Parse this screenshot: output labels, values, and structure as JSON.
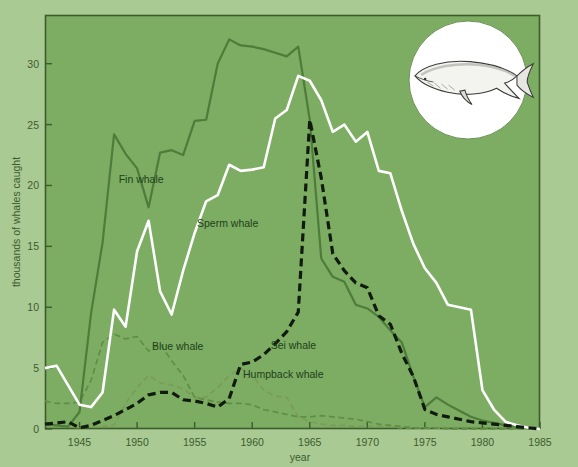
{
  "figure": {
    "outer_background": "#a9ca92",
    "plot_background": "#7dad63",
    "plot_border_color": "#3d5c2e",
    "inset": {
      "name": "blue-whale-illustration",
      "shape": "circle",
      "background": "#ffffff",
      "caption": ""
    }
  },
  "axes": {
    "x": {
      "label": "year",
      "ticks": [
        1945,
        1950,
        1955,
        1960,
        1965,
        1970,
        1975,
        1980,
        1985
      ],
      "tick_labels": [
        "1945",
        "1950",
        "1955",
        "1960",
        "1965",
        "1970",
        "1975",
        "1980",
        "1985"
      ],
      "range": [
        1942,
        1985
      ]
    },
    "y": {
      "label": "thousands of whales caught",
      "ticks": [
        0,
        5,
        10,
        15,
        20,
        25,
        30
      ],
      "tick_labels": [
        "0",
        "5",
        "10",
        "15",
        "20",
        "25",
        "30"
      ],
      "range": [
        0,
        34
      ]
    }
  },
  "chart_data": {
    "type": "line",
    "title": "",
    "subtitle": "",
    "xlabel": "year",
    "ylabel": "thousands of whales caught",
    "xlim": [
      1942,
      1985
    ],
    "ylim": [
      0,
      34
    ],
    "grid": false,
    "legend_position": "inline-labels",
    "x": [
      1942,
      1943,
      1944,
      1945,
      1946,
      1947,
      1948,
      1949,
      1950,
      1951,
      1952,
      1953,
      1954,
      1955,
      1956,
      1957,
      1958,
      1959,
      1960,
      1961,
      1962,
      1963,
      1964,
      1965,
      1966,
      1967,
      1968,
      1969,
      1970,
      1971,
      1972,
      1973,
      1974,
      1975,
      1976,
      1977,
      1978,
      1979,
      1980,
      1981,
      1982,
      1983,
      1984,
      1985
    ],
    "series": [
      {
        "name": "Fin whale",
        "color": "#4e7c3a",
        "style": "solid",
        "label_text": "Fin whale",
        "label_x": 1948.4,
        "label_y": 20.2,
        "values": [
          0.4,
          0.3,
          0.2,
          1.4,
          9.5,
          15.3,
          24.2,
          22.6,
          21.4,
          18.2,
          22.7,
          22.9,
          22.5,
          25.3,
          25.4,
          30.0,
          32.0,
          31.5,
          31.4,
          31.2,
          30.9,
          30.6,
          31.4,
          25.4,
          14.0,
          12.5,
          12.1,
          10.2,
          9.9,
          9.2,
          8.1,
          7.1,
          4.3,
          1.8,
          2.6,
          2.0,
          1.5,
          1.0,
          0.7,
          0.5,
          0.3,
          0.2,
          0.1,
          0.0
        ]
      },
      {
        "name": "Sperm whale",
        "color": "#ffffff",
        "style": "solid",
        "label_text": "Sperm whale",
        "label_x": 1955.2,
        "label_y": 16.6,
        "values": [
          5.0,
          5.2,
          3.6,
          2.0,
          1.8,
          3.0,
          9.8,
          8.4,
          14.6,
          17.1,
          11.3,
          9.4,
          13.0,
          16.1,
          18.7,
          19.2,
          21.7,
          21.2,
          21.3,
          21.5,
          25.5,
          26.2,
          29.0,
          28.6,
          27.0,
          24.4,
          25.0,
          23.6,
          24.4,
          21.2,
          21.0,
          17.9,
          15.2,
          13.2,
          12.0,
          10.2,
          10.0,
          9.8,
          3.2,
          1.6,
          0.6,
          0.3,
          0.1,
          0.0
        ]
      },
      {
        "name": "Sei whale",
        "color": "#101a0e",
        "style": "dashed",
        "label_text": "Sei whale",
        "label_x": 1961.6,
        "label_y": 6.6,
        "values": [
          0.4,
          0.5,
          0.6,
          0.1,
          0.3,
          0.7,
          1.1,
          1.6,
          2.1,
          2.8,
          3.0,
          3.0,
          2.4,
          2.3,
          2.1,
          1.8,
          2.5,
          5.3,
          5.5,
          6.1,
          7.0,
          8.0,
          9.6,
          25.4,
          20.6,
          14.4,
          13.0,
          12.0,
          11.6,
          9.3,
          8.6,
          6.2,
          4.3,
          1.6,
          1.2,
          1.0,
          0.8,
          0.6,
          0.5,
          0.4,
          0.3,
          0.2,
          0.1,
          0.0
        ]
      },
      {
        "name": "Blue whale",
        "color": "#5d8f44",
        "style": "dashed",
        "label_text": "Blue whale",
        "label_x": 1951.3,
        "label_y": 6.5,
        "values": [
          2.3,
          2.1,
          2.1,
          2.2,
          4.0,
          7.1,
          7.8,
          7.4,
          7.6,
          6.4,
          7.0,
          5.6,
          4.4,
          2.6,
          2.4,
          2.2,
          2.1,
          2.1,
          2.0,
          1.6,
          1.4,
          1.2,
          1.0,
          1.0,
          1.1,
          1.0,
          0.9,
          0.8,
          0.6,
          0.4,
          0.3,
          0.2,
          0.1,
          0.1,
          0.1,
          0.0,
          0.0,
          0.0,
          0.0,
          0.0,
          0.0,
          0.0,
          0.0,
          0.0
        ]
      },
      {
        "name": "Humpback whale",
        "color": "#7a9c58",
        "style": "dashed",
        "label_text": "Humpback whale",
        "label_x": 1959.2,
        "label_y": 4.2,
        "values": [
          0.3,
          0.2,
          0.2,
          0.1,
          0.2,
          0.2,
          0.3,
          2.1,
          3.4,
          4.4,
          3.8,
          3.6,
          3.3,
          2.6,
          2.6,
          3.4,
          4.4,
          5.0,
          4.4,
          3.2,
          2.7,
          2.6,
          1.0,
          0.6,
          0.4,
          0.3,
          0.3,
          0.2,
          0.2,
          0.2,
          0.2,
          0.1,
          0.1,
          0.1,
          0.1,
          0.0,
          0.0,
          0.0,
          0.0,
          0.0,
          0.0,
          0.0,
          0.0,
          0.0
        ]
      }
    ]
  }
}
